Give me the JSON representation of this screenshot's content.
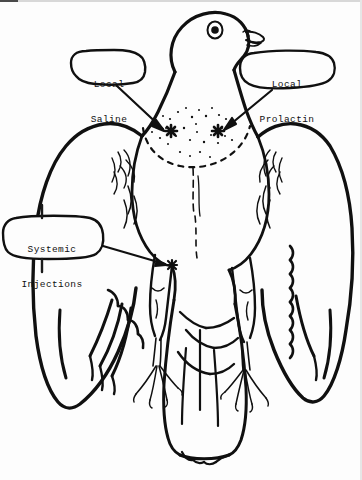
{
  "figure": {
    "view": "ventral front view with wings spread",
    "background_color": "#fdfdfd",
    "ink_color": "#101010"
  },
  "callouts": [
    {
      "id": "local-saline",
      "line1": "Local",
      "line2": "Saline",
      "target": "left crop injection site",
      "marker": "asterisk"
    },
    {
      "id": "local-prolactin",
      "line1": "Local",
      "line2": "Prolactin",
      "target": "right crop injection site",
      "marker": "asterisk"
    },
    {
      "id": "systemic-injections",
      "line1": "Systemic",
      "line2": "Injections",
      "target": "left breast/pectoral injection site",
      "marker": "asterisk"
    }
  ],
  "markers": {
    "local_saline_site": {
      "x": 171,
      "y": 131
    },
    "local_prolactin_site": {
      "x": 218,
      "y": 131
    },
    "systemic_site": {
      "x": 172,
      "y": 265
    }
  }
}
